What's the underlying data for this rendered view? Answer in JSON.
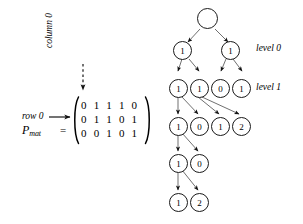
{
  "figure": {
    "background": "#ffffff",
    "ink": "#000000"
  },
  "matrix_block": {
    "row_label": "row 0",
    "column_label": "column 0",
    "name": "P",
    "name_subscript": "mat",
    "equals": "=",
    "bracket_style": "parenthesis",
    "rows": [
      "0 1 1 1 0",
      "0 1 1 0 1",
      "0 0 1 0 1"
    ],
    "matrix": [
      [
        0,
        1,
        1,
        1,
        0
      ],
      [
        0,
        1,
        1,
        0,
        1
      ],
      [
        0,
        0,
        1,
        0,
        1
      ]
    ]
  },
  "tree": {
    "level_labels": [
      "level 0",
      "level 1"
    ],
    "root_label": "",
    "levels": [
      {
        "name": "root",
        "values": [
          ""
        ]
      },
      {
        "name": "level 0",
        "values": [
          "1",
          "1"
        ]
      },
      {
        "name": "level 1",
        "values": [
          "1",
          "1",
          "0",
          "1"
        ]
      },
      {
        "name": "level 2",
        "values": [
          "1",
          "0",
          "1",
          "2"
        ]
      },
      {
        "name": "level 3",
        "values": [
          "1",
          "0"
        ]
      },
      {
        "name": "level 4",
        "values": [
          "1",
          "2"
        ]
      }
    ]
  }
}
